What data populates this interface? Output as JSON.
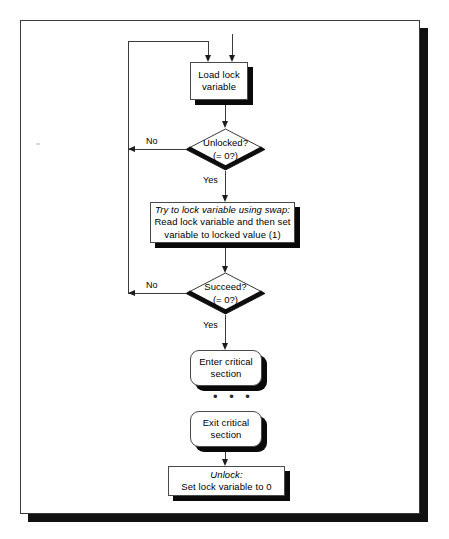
{
  "diagram": {
    "type": "flowchart",
    "nodes": {
      "load": {
        "shape": "rectangle",
        "line1": "Load lock",
        "line2": "variable"
      },
      "unlocked": {
        "shape": "diamond",
        "line1": "Unlocked?",
        "line2": "(= 0?)"
      },
      "swap": {
        "shape": "rectangle",
        "line1": "Try to lock variable using swap:",
        "line2": "Read lock variable and then set",
        "line3": "variable to locked value (1)"
      },
      "succeed": {
        "shape": "diamond",
        "line1": "Succeed?",
        "line2": "(= 0?)"
      },
      "enter": {
        "shape": "rounded-rectangle",
        "line1": "Enter critical",
        "line2": "section"
      },
      "gap": {
        "shape": "ellipsis",
        "text": "• • •"
      },
      "exit": {
        "shape": "rounded-rectangle",
        "line1": "Exit critical",
        "line2": "section"
      },
      "unlock": {
        "shape": "rectangle",
        "line1": "Unlock:",
        "line2": "Set lock variable to 0"
      }
    },
    "edge_labels": {
      "unlocked_no": "No",
      "unlocked_yes": "Yes",
      "succeed_no": "No",
      "succeed_yes": "Yes"
    },
    "colors": {
      "background": "#ffffff",
      "stroke": "#3b3b3b",
      "shadow": "#0a0a0a",
      "text": "#000000"
    }
  }
}
